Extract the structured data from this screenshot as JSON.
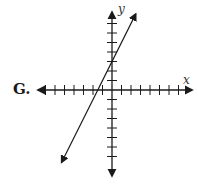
{
  "choice_label": "G.",
  "axes": {
    "x_label": "x",
    "y_label": "y"
  },
  "colors": {
    "ink": "#1a1a1a",
    "background": "#ffffff"
  },
  "chart_data": {
    "type": "line",
    "title": "",
    "xlabel": "x",
    "ylabel": "y",
    "x_ticks_each_side": 7,
    "y_ticks_each_side": 7,
    "xlim": [
      -8,
      8
    ],
    "ylim": [
      -8,
      8
    ],
    "grid": false,
    "series": [
      {
        "name": "line",
        "equation": "y = 2x + 3",
        "slope": 2,
        "y_intercept": 3,
        "x_intercept": -1.5,
        "arrows_both_ends": true
      }
    ]
  }
}
